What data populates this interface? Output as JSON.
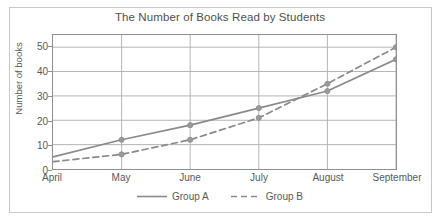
{
  "chart_data": {
    "type": "line",
    "title": "The Number of Books Read by Students",
    "xlabel": "",
    "ylabel": "Number of books",
    "categories": [
      "April",
      "May",
      "June",
      "July",
      "August",
      "September"
    ],
    "series": [
      {
        "name": "Group A",
        "style": "solid",
        "color": "#8a8a8a",
        "values": [
          5,
          12,
          18,
          25,
          32,
          45
        ],
        "markers": [
          false,
          true,
          true,
          true,
          true,
          true
        ]
      },
      {
        "name": "Group B",
        "style": "dashed",
        "color": "#8a8a8a",
        "values": [
          3,
          6,
          12,
          21,
          35,
          50
        ],
        "markers": [
          false,
          true,
          true,
          true,
          true,
          true
        ]
      }
    ],
    "ylim": [
      0,
      55
    ],
    "yticks": [
      0,
      10,
      20,
      30,
      40,
      50
    ],
    "ytick_labels": [
      "0",
      "10",
      "20",
      "30",
      "40",
      "50"
    ],
    "grid": {
      "horizontal": true,
      "vertical": true,
      "color": "#b5b5b5"
    },
    "legend": {
      "position": "bottom",
      "entries": [
        "Group A",
        "Group B"
      ]
    },
    "axis_color": "#8f8f8f",
    "text_color": "#595959",
    "background": "#ffffff"
  }
}
